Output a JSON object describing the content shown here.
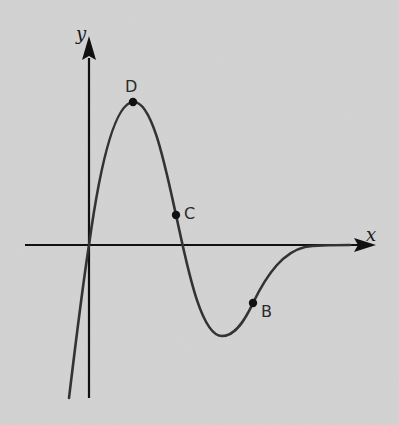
{
  "diagram": {
    "type": "function-graph",
    "axes": {
      "x_label": "x",
      "y_label": "y",
      "origin_px": [
        89,
        245
      ]
    },
    "curve": {
      "description": "Curve passes through origin rising steeply, peaks at D, falls through C, crosses x-axis, reaches minimum, rises through B and approaches x-axis asymptotically to the right"
    },
    "points": [
      {
        "label": "D",
        "px": [
          133,
          102
        ],
        "note": "local maximum"
      },
      {
        "label": "C",
        "px": [
          176,
          215
        ],
        "note": "on decreasing part above x-axis"
      },
      {
        "label": "B",
        "px": [
          253,
          303
        ],
        "note": "on increasing part below x-axis"
      }
    ],
    "colors": {
      "background": "#d3d3d3",
      "axis": "#111111",
      "curve": "#333333",
      "point": "#111111"
    }
  }
}
